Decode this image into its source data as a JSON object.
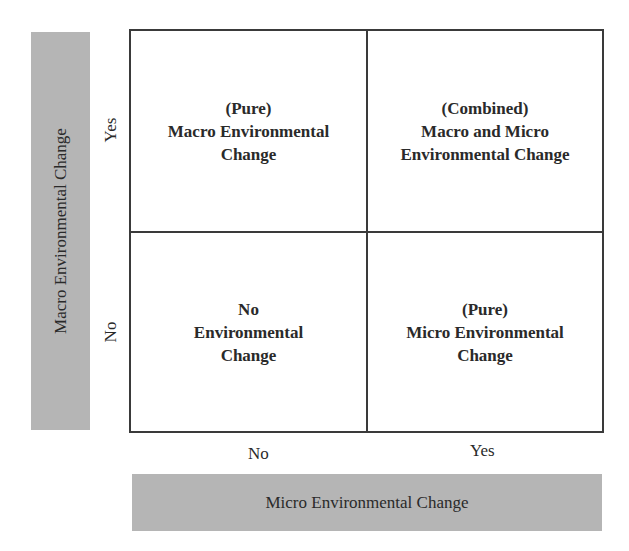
{
  "diagram": {
    "type": "2x2 matrix",
    "y_axis": {
      "label": "Macro Environmental Change",
      "ticks": [
        "Yes",
        "No"
      ]
    },
    "x_axis": {
      "label": "Micro Environmental Change",
      "ticks": [
        "No",
        "Yes"
      ]
    },
    "cells": {
      "top_left": {
        "line1": "(Pure)",
        "line2": "Macro Environmental",
        "line3": "Change"
      },
      "top_right": {
        "line1": "(Combined)",
        "line2": "Macro and Micro",
        "line3": "Environmental Change"
      },
      "bottom_left": {
        "line1": "No",
        "line2": "Environmental",
        "line3": "Change"
      },
      "bottom_right": {
        "line1": "(Pure)",
        "line2": "Micro Environmental",
        "line3": "Change"
      }
    },
    "colors": {
      "axis_bar": "#b5b5b5",
      "grid_line": "#3a3a3a",
      "text": "#2a2a2a"
    }
  }
}
